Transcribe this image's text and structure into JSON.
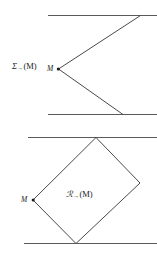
{
  "figure": {
    "width": 157,
    "height": 256,
    "background_color": "#ffffff",
    "stroke_color": "#555555",
    "text_color": "#1a1a1a",
    "panels": [
      {
        "id": "upper",
        "label_text": "Σ",
        "label_subscript": "→",
        "label_argument": "(M)",
        "label_full": "Σ→(M)",
        "point_label": "M",
        "shape": "open-wedge",
        "description": "Two horizontal parallel lines with a rightward-opening wedge from vertex M"
      },
      {
        "id": "lower",
        "label_text": "ℛ",
        "label_subscript": "→",
        "label_argument": "(M)",
        "label_full": "ℛ→(M)",
        "point_label": "M",
        "shape": "tilted-rectangle",
        "description": "Two horizontal parallel lines with an inscribed tilted rectangle touching both lines, left vertex at M"
      }
    ],
    "geometry": {
      "upper_panel": {
        "line_top": {
          "x1": 48,
          "y1": 15,
          "x2": 157,
          "y2": 15
        },
        "line_bottom": {
          "x1": 48,
          "y1": 114,
          "x2": 157,
          "y2": 114
        },
        "vertex_m": {
          "x": 58,
          "y": 69
        },
        "ray_upper_end": {
          "x": 140,
          "y": 15
        },
        "ray_lower_end": {
          "x": 123,
          "y": 114
        }
      },
      "lower_panel": {
        "line_top": {
          "x1": 28,
          "y1": 137,
          "x2": 157,
          "y2": 137
        },
        "line_bottom": {
          "x1": 24,
          "y1": 243,
          "x2": 157,
          "y2": 243
        },
        "vertex_m": {
          "x": 33,
          "y": 200
        },
        "vertex_top": {
          "x": 96,
          "y": 137
        },
        "vertex_right": {
          "x": 140,
          "y": 183
        },
        "vertex_bottom": {
          "x": 76,
          "y": 243
        }
      }
    }
  }
}
